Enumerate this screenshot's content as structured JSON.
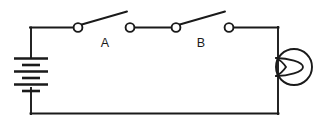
{
  "diagram": {
    "type": "electrical-schematic",
    "background_color": "#ffffff",
    "line_color": "#1a1a1a",
    "width": 322,
    "height": 129
  },
  "components": {
    "battery": {
      "name": "battery",
      "symbol": "multi-cell-battery",
      "orientation": "vertical",
      "cells": 3,
      "plate_count": 6,
      "position": {
        "x": 31,
        "y": 78
      }
    },
    "switch_a": {
      "name": "switch-a",
      "label": "A",
      "state": "open",
      "label_position": {
        "x": 105,
        "y": 46
      },
      "pivot": {
        "x": 78,
        "y": 27
      },
      "terminal": {
        "x": 130,
        "y": 27
      },
      "blade_tip": {
        "x": 127,
        "y": 11
      }
    },
    "switch_b": {
      "name": "switch-b",
      "label": "B",
      "state": "open",
      "label_position": {
        "x": 201,
        "y": 46
      },
      "pivot": {
        "x": 176,
        "y": 27
      },
      "terminal": {
        "x": 229,
        "y": 27
      },
      "blade_tip": {
        "x": 225,
        "y": 11
      }
    },
    "lamp": {
      "name": "lamp",
      "symbol": "lamp-bulb",
      "center": {
        "x": 294,
        "y": 67
      },
      "radius": 18
    }
  },
  "wires": {
    "top_left_segment": "from battery top (31,27) right to switch A pivot (78,27)",
    "between_switches": "from switch A terminal (130,27) right to switch B pivot (176,27)",
    "top_right_segment": "from switch B terminal (229,27) right to corner (278,27)",
    "right_vertical": "from corner (278,27) down to corner (278,114)",
    "bottom": "from corner (278,114) left to corner (31,114)",
    "left_vertical": "from corner (31,114) up to battery bottom (31,92)"
  },
  "labels": {
    "switch_a": "A",
    "switch_b": "B"
  }
}
